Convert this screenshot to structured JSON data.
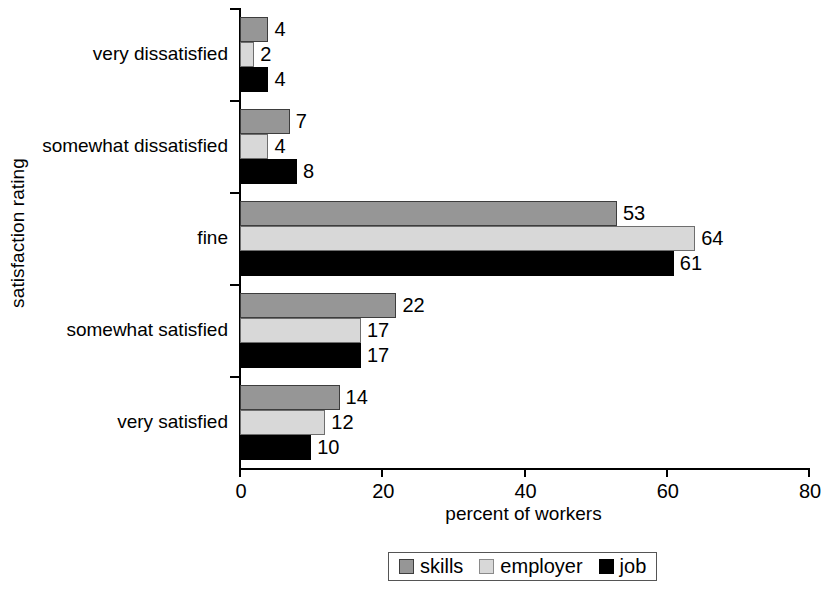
{
  "chart_data": {
    "type": "bar",
    "orientation": "horizontal",
    "title": "",
    "xlabel": "percent of workers",
    "ylabel": "satisfaction rating",
    "categories": [
      "very dissatisfied",
      "somewhat dissatisfied",
      "fine",
      "somewhat satisfied",
      "very satisfied"
    ],
    "series": [
      {
        "name": "skills",
        "color": "#969696",
        "values": [
          4,
          7,
          53,
          22,
          14
        ]
      },
      {
        "name": "employer",
        "color": "#d8d8d8",
        "values": [
          2,
          4,
          64,
          17,
          12
        ]
      },
      {
        "name": "job",
        "color": "#000000",
        "values": [
          4,
          8,
          61,
          17,
          10
        ]
      }
    ],
    "xlim": [
      0,
      80
    ],
    "xticks": [
      0,
      20,
      40,
      60,
      80
    ],
    "xtick_labels": [
      "0",
      "20",
      "40",
      "60",
      "80"
    ],
    "grid": false,
    "data_labels": true,
    "legend_position": "bottom"
  },
  "legend": {
    "items": [
      {
        "label": "skills",
        "swatch": "skills-swatch"
      },
      {
        "label": "employer",
        "swatch": "employer-swatch"
      },
      {
        "label": "job",
        "swatch": "job-swatch"
      }
    ]
  }
}
